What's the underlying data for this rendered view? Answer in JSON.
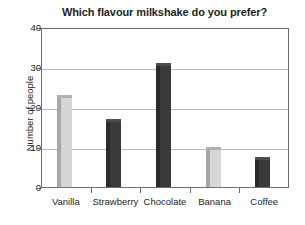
{
  "chart_data": {
    "type": "bar",
    "title": "Which flavour milkshake do you prefer?",
    "xlabel": "",
    "ylabel": "Number of people",
    "categories": [
      "Vanilla",
      "Strawberry",
      "Chocolate",
      "Banana",
      "Coffee"
    ],
    "values": [
      23,
      17,
      31,
      10,
      7.5
    ],
    "series": [
      {
        "name": "Number of people",
        "values": [
          23,
          17,
          31,
          10,
          7.5
        ]
      }
    ],
    "ylim": [
      0,
      40
    ],
    "yticks": [
      0,
      10,
      20,
      30,
      40
    ],
    "ytick_labels": [
      "0",
      "10",
      "20",
      "30",
      "40"
    ],
    "grid": "horizontal",
    "legend": "none",
    "bar_styles": [
      "light",
      "dark",
      "dark",
      "light",
      "dark"
    ],
    "colors": {
      "bar_light": "#d6d6d6",
      "bar_light_edge": "#a8a8a8",
      "bar_dark": "#3a3a3a",
      "bar_dark_edge": "#2a2a2a",
      "gridline": "#b9b9b9",
      "axis": "#6f6f6f",
      "text": "#231f20",
      "background": "#ffffff"
    }
  }
}
